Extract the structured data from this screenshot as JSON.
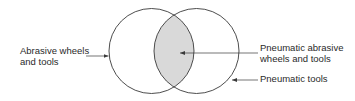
{
  "diagram": {
    "type": "venn",
    "sets": [
      {
        "id": "left",
        "label_lines": [
          "Abrasive wheels",
          "and tools"
        ]
      },
      {
        "id": "right",
        "label_lines": [
          "Pneumatic tools"
        ]
      }
    ],
    "intersection": {
      "label_lines": [
        "Pneumatic abrasive",
        "wheels and tools"
      ]
    },
    "colors": {
      "stroke": "#3a3a3a",
      "intersection_fill": "#d9d9d9",
      "background": "#ffffff",
      "text": "#2a2a2a"
    }
  }
}
